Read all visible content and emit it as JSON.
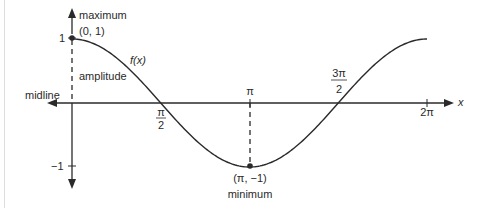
{
  "diagram": {
    "function_label": "f(x)",
    "axis": {
      "x_label": "x",
      "midline_label": "midline"
    },
    "y_ticks": [
      {
        "label": "1",
        "value": 1
      },
      {
        "label": "−1",
        "value": -1
      }
    ],
    "x_ticks": [
      {
        "num": "π",
        "den": "2",
        "value": 1.5708
      },
      {
        "label": "π",
        "value": 3.1416
      },
      {
        "num": "3π",
        "den": "2",
        "value": 4.7124
      },
      {
        "label": "2π",
        "value": 6.2832
      }
    ],
    "annotations": {
      "maximum_label": "maximum",
      "maximum_point": "(0, 1)",
      "minimum_label": "minimum",
      "minimum_point": "(π, −1)",
      "amplitude_label": "amplitude"
    },
    "colors": {
      "stroke": "#2a2a2a",
      "frame": "#dddddd",
      "background": "#ffffff"
    }
  }
}
